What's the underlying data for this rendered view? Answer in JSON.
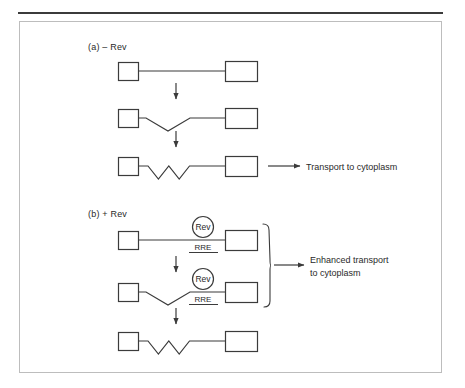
{
  "figure": {
    "panels": [
      {
        "id": "panel-a",
        "label": "(a)  – Rev",
        "label_x": 88,
        "label_y": 42,
        "rows": [
          {
            "id": "a-row-1",
            "y": 71,
            "kinks": 0,
            "rev_bound": false,
            "left_box": {
              "x": 118,
              "y": 62,
              "w": 20,
              "h": 18
            },
            "right_box": {
              "x": 225,
              "y": 61,
              "w": 32,
              "h": 20
            },
            "line_from": 138,
            "line_to": 225
          },
          {
            "id": "a-row-2",
            "y": 118,
            "kinks": 1,
            "rev_bound": false,
            "left_box": {
              "x": 118,
              "y": 109,
              "w": 20,
              "h": 18
            },
            "right_box": {
              "x": 225,
              "y": 108,
              "w": 32,
              "h": 20
            },
            "line_from": 138,
            "line_to": 225
          },
          {
            "id": "a-row-3",
            "y": 166,
            "kinks": 2,
            "rev_bound": false,
            "left_box": {
              "x": 118,
              "y": 157,
              "w": 20,
              "h": 18
            },
            "right_box": {
              "x": 225,
              "y": 156,
              "w": 32,
              "h": 20
            },
            "line_from": 138,
            "line_to": 225
          }
        ],
        "arrows_down": [
          {
            "id": "a-arrow-1",
            "x": 176,
            "y1": 83,
            "y2": 99
          },
          {
            "id": "a-arrow-2",
            "x": 176,
            "y1": 131,
            "y2": 147
          }
        ],
        "output": {
          "id": "transport-arrow-a",
          "arrow_x1": 268,
          "arrow_x2": 300,
          "arrow_y": 166,
          "label": "Transport to cytoplasm",
          "label_x": 306,
          "label_y": 161
        }
      },
      {
        "id": "panel-b",
        "label": "(b)  + Rev",
        "label_x": 88,
        "label_y": 209,
        "rows": [
          {
            "id": "b-row-1",
            "y": 240,
            "kinks": 0,
            "rev_bound": true,
            "left_box": {
              "x": 118,
              "y": 231,
              "w": 20,
              "h": 18
            },
            "right_box": {
              "x": 225,
              "y": 230,
              "w": 32,
              "h": 20
            },
            "line_from": 138,
            "line_to": 225,
            "rev_circle": {
              "cx": 203,
              "cy": 227,
              "r": 10.5,
              "label": "Rev"
            },
            "rre": {
              "x": 203,
              "y": 250,
              "label": "RRE",
              "underline_from": 189,
              "underline_to": 218
            }
          },
          {
            "id": "b-row-2",
            "y": 292,
            "kinks": 1,
            "rev_bound": true,
            "left_box": {
              "x": 118,
              "y": 283,
              "w": 20,
              "h": 18
            },
            "right_box": {
              "x": 225,
              "y": 282,
              "w": 32,
              "h": 20
            },
            "line_from": 138,
            "line_to": 225,
            "rev_circle": {
              "cx": 203,
              "cy": 279,
              "r": 10.5,
              "label": "Rev"
            },
            "rre": {
              "x": 203,
              "y": 302,
              "label": "RRE",
              "underline_from": 189,
              "underline_to": 218
            }
          },
          {
            "id": "b-row-3",
            "y": 341,
            "kinks": 2,
            "rev_bound": false,
            "left_box": {
              "x": 118,
              "y": 332,
              "w": 20,
              "h": 18
            },
            "right_box": {
              "x": 225,
              "y": 331,
              "w": 32,
              "h": 20
            },
            "line_from": 138,
            "line_to": 225
          }
        ],
        "arrows_down": [
          {
            "id": "b-arrow-1",
            "x": 176,
            "y1": 256,
            "y2": 272
          },
          {
            "id": "b-arrow-2",
            "x": 176,
            "y1": 308,
            "y2": 324
          }
        ],
        "brace": {
          "id": "enhanced-brace",
          "x": 264,
          "y_top": 224,
          "y_bottom": 307,
          "tip_x": 271
        },
        "output": {
          "id": "transport-arrow-b",
          "arrow_x1": 274,
          "arrow_x2": 304,
          "arrow_y": 265,
          "label": "Enhanced transport\nto cytoplasm",
          "label_x": 310,
          "label_y": 254
        }
      }
    ],
    "colors": {
      "stroke": "#3b3b3b",
      "text": "#2a2a2a",
      "frame": "#bdbdbd",
      "background": "#ffffff"
    }
  }
}
